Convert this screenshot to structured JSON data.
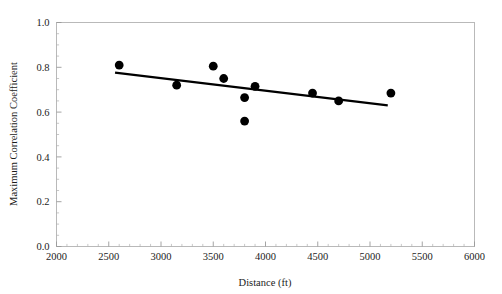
{
  "chart_data": {
    "type": "scatter",
    "title": "",
    "subtitle": "",
    "xlabel": "Distance (ft)",
    "ylabel": "Maximum Correlation Coefficient",
    "xlim": [
      2000,
      6000
    ],
    "ylim": [
      0.0,
      1.0
    ],
    "xticks": [
      2000,
      2500,
      3000,
      3500,
      4000,
      4500,
      5000,
      5500,
      6000
    ],
    "xtick_labels": [
      "2000",
      "2500",
      "3000",
      "3500",
      "4000",
      "4500",
      "5000",
      "5500",
      "6000"
    ],
    "yticks": [
      0.0,
      0.2,
      0.4,
      0.6,
      0.8,
      1.0
    ],
    "ytick_labels": [
      "0.0",
      "0.2",
      "0.4",
      "0.6",
      "0.8",
      "1.0"
    ],
    "x_minor_tick_interval": 100,
    "y_minor_tick_interval": 0.05,
    "grid": false,
    "legend": null,
    "legend_position": "none",
    "marker": {
      "shape": "circle",
      "color": "#000000",
      "size_px": 4.4
    },
    "series": [
      {
        "name": "Maximum correlation coefficient vs distance",
        "type": "scatter",
        "points": [
          {
            "x": 2600,
            "y": 0.81
          },
          {
            "x": 3150,
            "y": 0.72
          },
          {
            "x": 3500,
            "y": 0.805
          },
          {
            "x": 3600,
            "y": 0.75
          },
          {
            "x": 3800,
            "y": 0.665
          },
          {
            "x": 3800,
            "y": 0.56
          },
          {
            "x": 3900,
            "y": 0.715
          },
          {
            "x": 4450,
            "y": 0.685
          },
          {
            "x": 4700,
            "y": 0.65
          },
          {
            "x": 5200,
            "y": 0.685
          }
        ]
      },
      {
        "name": "Linear trend line",
        "type": "line",
        "color": "#000000",
        "points": [
          {
            "x": 2560,
            "y": 0.776
          },
          {
            "x": 5170,
            "y": 0.63
          }
        ]
      }
    ]
  },
  "axis": {
    "x_title": "Distance (ft)",
    "y_title": "Maximum Correlation Coefficient"
  }
}
